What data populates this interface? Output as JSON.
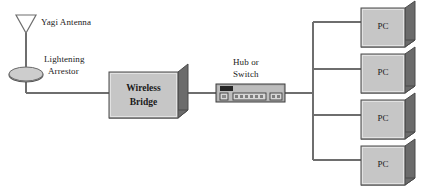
{
  "diagram": {
    "canvas": {
      "width": 425,
      "height": 196
    },
    "colors": {
      "line": "#6e6e6e",
      "box_fill": "#c8c8c8",
      "box_fill_light": "#d2d2d2",
      "box_stroke": "#555555",
      "shadow": "#7a7a7a",
      "shadow_dark": "#5e5e5e",
      "text": "#1a1a1a",
      "background": "#ffffff",
      "device_body": "#b4b4b4",
      "device_dark": "#2e2e2e"
    },
    "nodes": {
      "antenna": {
        "label": "Yagi Antenna",
        "icon": "yagi-antenna-icon"
      },
      "arrestor": {
        "label_line1": "Lightening",
        "label_line2": "Arrestor",
        "icon": "lightening-arrestor-icon"
      },
      "wireless_bridge": {
        "label_line1": "Wireless",
        "label_line2": "Bridge"
      },
      "hub": {
        "label_line1": "Hub or",
        "label_line2": "Switch",
        "icon": "hub-switch-icon",
        "port_count": 6,
        "side_port_count": 2,
        "uplink_port_count": 1
      },
      "computers": [
        {
          "label": "PC"
        },
        {
          "label": "PC"
        },
        {
          "label": "PC"
        },
        {
          "label": "PC"
        }
      ]
    }
  }
}
